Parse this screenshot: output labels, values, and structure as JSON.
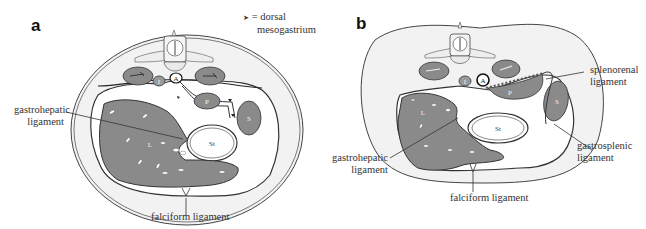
{
  "figure": {
    "panels": [
      {
        "id": "a",
        "letter": "a",
        "legend": {
          "symbol": "➤",
          "text_line1": "= dorsal",
          "text_line2": "mesogastrium"
        },
        "labels": {
          "gastrohepatic_line1": "gastrohepatic",
          "gastrohepatic_line2": "ligament",
          "falciform": "falciform ligament"
        },
        "organs": {
          "aorta": "A",
          "ivc": "I",
          "pancreas": "P",
          "spleen": "S",
          "stomach": "St",
          "liver": "L"
        }
      },
      {
        "id": "b",
        "letter": "b",
        "labels": {
          "splenorenal_line1": "splenorenal",
          "splenorenal_line2": "ligament",
          "gastrosplenic_line1": "gastrosplenic",
          "gastrosplenic_line2": "ligament",
          "gastrohepatic_line1": "gastrohepatic",
          "gastrohepatic_line2": "ligament",
          "falciform": "falciform ligament"
        },
        "organs": {
          "aorta": "A",
          "ivc": "I",
          "pancreas": "P",
          "spleen": "S",
          "stomach": "St",
          "liver": "L"
        }
      }
    ],
    "colors": {
      "organ_fill": "#8a8a8a",
      "body_wall": "#f2f2f2",
      "outline": "#333333",
      "background": "#ffffff"
    }
  }
}
